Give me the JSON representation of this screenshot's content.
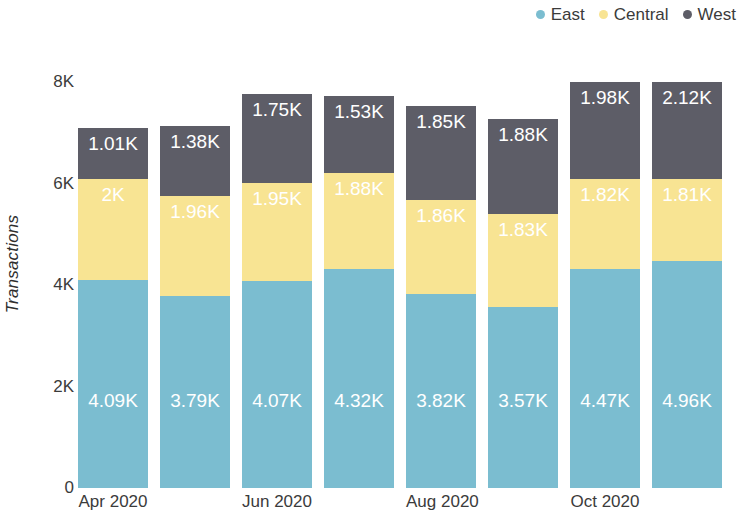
{
  "chart_data": {
    "type": "bar",
    "stacked": true,
    "title": "",
    "subtitle": "",
    "xlabel": "",
    "ylabel": "Transactions",
    "ylim": [
      0,
      8000
    ],
    "yticks": [
      0,
      2000,
      4000,
      6000,
      8000
    ],
    "ytick_labels": [
      "0",
      "2K",
      "4K",
      "6K",
      "8K"
    ],
    "grid": false,
    "legend_position": "top-right",
    "categories": [
      "Apr 2020",
      "May 2020",
      "Jun 2020",
      "Jul 2020",
      "Aug 2020",
      "Sep 2020",
      "Oct 2020",
      "Nov 2020"
    ],
    "xtick_labels": [
      "Apr 2020",
      "",
      "Jun 2020",
      "",
      "Aug 2020",
      "",
      "Oct 2020",
      ""
    ],
    "series": [
      {
        "name": "East",
        "color": "#7BBDD0",
        "values": [
          4090,
          3790,
          4070,
          4320,
          3820,
          3570,
          4470,
          4960
        ],
        "data_labels": [
          "4.09K",
          "3.79K",
          "4.07K",
          "4.32K",
          "3.82K",
          "3.57K",
          "4.47K",
          "4.96K"
        ]
      },
      {
        "name": "Central",
        "color": "#F8E493",
        "values": [
          2000,
          1960,
          1950,
          1880,
          1860,
          1830,
          1820,
          1810
        ],
        "data_labels": [
          "2K",
          "1.96K",
          "1.95K",
          "1.88K",
          "1.86K",
          "1.83K",
          "1.82K",
          "1.81K"
        ]
      },
      {
        "name": "West",
        "color": "#5D5D67",
        "values": [
          1010,
          1380,
          1750,
          1530,
          1850,
          1880,
          1980,
          2120
        ],
        "data_labels": [
          "1.01K",
          "1.38K",
          "1.75K",
          "1.53K",
          "1.85K",
          "1.88K",
          "1.98K",
          "2.12K"
        ]
      }
    ],
    "totals": [
      7100,
      7130,
      7770,
      7730,
      7530,
      7280,
      8270,
      8890
    ],
    "data_label_color": "#ffffff"
  },
  "legend": {
    "items": [
      {
        "label": "East",
        "color": "#7BBDD0",
        "marker": "circle-marker"
      },
      {
        "label": "Central",
        "color": "#F8E493",
        "marker": "circle-marker"
      },
      {
        "label": "West",
        "color": "#5D5D67",
        "marker": "circle-marker"
      }
    ]
  },
  "axes": {
    "y_title": "Transactions"
  }
}
